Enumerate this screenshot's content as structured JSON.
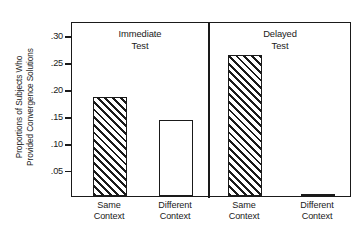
{
  "chart_data": {
    "type": "bar",
    "title": "",
    "subtitle": "",
    "xlabel": "",
    "ylabel": "Proportions of Subjects Who Provided Convergence Solutions",
    "ylabel_lines": [
      "Proportions of Subjects Who",
      "Provided Convergence Solutions"
    ],
    "ylim": [
      0,
      0.325
    ],
    "yticks": [
      0.05,
      0.1,
      0.15,
      0.2,
      0.25,
      0.3
    ],
    "ytick_labels": [
      ".05",
      ".10",
      ".15",
      ".20",
      ".25",
      ".30"
    ],
    "grid": false,
    "legend": false,
    "legend_position": "none",
    "panels": [
      {
        "title": "Immediate Test",
        "title_lines": [
          "Immediate",
          "Test"
        ],
        "categories": [
          "Same Context",
          "Different Context"
        ],
        "category_lines": [
          [
            "Same",
            "Context"
          ],
          [
            "Different",
            "Context"
          ]
        ],
        "values": [
          0.183,
          0.142
        ],
        "fills": [
          "hatched",
          "open"
        ]
      },
      {
        "title": "Delayed Test",
        "title_lines": [
          "Delayed",
          "Test"
        ],
        "categories": [
          "Same Context",
          "Different Context"
        ],
        "category_lines": [
          [
            "Same",
            "Context"
          ],
          [
            "Different",
            "Context"
          ]
        ],
        "values": [
          0.262,
          0.004
        ],
        "fills": [
          "hatched",
          "open"
        ]
      }
    ],
    "colors": {
      "axis": "#1a1a1a",
      "bar_outline": "#1a1a1a",
      "hatch": "#1a1a1a",
      "background": "#ffffff"
    }
  }
}
